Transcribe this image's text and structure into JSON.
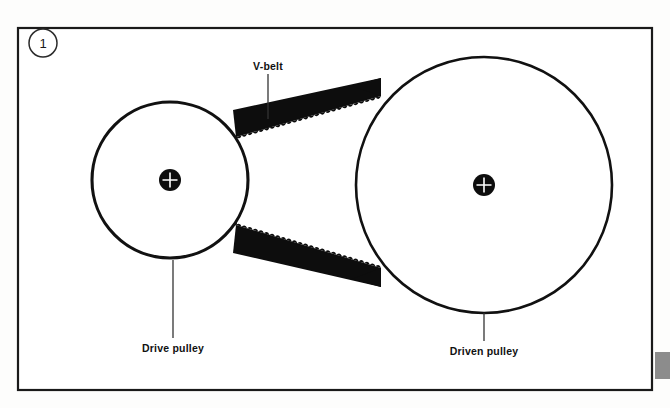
{
  "figure": {
    "badge_number": "1",
    "background_color": "#fdfdfc",
    "frame_color": "#1a1a1a",
    "ink_color": "#111111"
  },
  "labels": {
    "belt": "V-belt",
    "drive_pulley": "Drive pulley",
    "driven_pulley": "Driven pulley"
  },
  "components": {
    "drive_pulley": {
      "name": "Drive pulley",
      "center_x": 170,
      "center_y": 180,
      "radius": 78,
      "hub_radius": 11,
      "hub_fill": "#0d0d0d",
      "hub_cross_color": "#ffffff"
    },
    "driven_pulley": {
      "name": "Driven pulley",
      "center_x": 484,
      "center_y": 185,
      "radius": 128,
      "hub_radius": 11,
      "hub_fill": "#0d0d0d",
      "hub_cross_color": "#ffffff"
    },
    "belt": {
      "name": "V-belt",
      "fill": "#0d0d0d",
      "tooth_count_upper": 26,
      "tooth_count_lower": 26,
      "teeth_face": "inward"
    }
  },
  "leaders": {
    "belt_leader": {
      "x": 268,
      "y1": 74,
      "y2": 119
    },
    "drive_leader": {
      "x": 173,
      "y1": 260,
      "y2": 338
    },
    "driven_leader": {
      "x": 484,
      "y1": 313,
      "y2": 341
    }
  },
  "frame": {
    "x": 18,
    "y": 28,
    "width": 634,
    "height": 362
  },
  "side_tab": {
    "x": 655,
    "y": 352,
    "width": 15,
    "height": 27,
    "color": "#8c8c8c"
  }
}
